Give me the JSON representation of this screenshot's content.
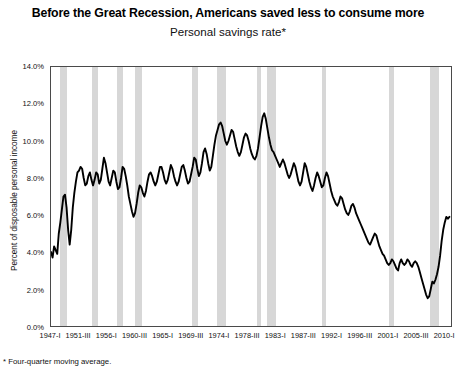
{
  "chart_data": {
    "type": "line",
    "title": "Before the Great Recession, Americans saved less to consume more",
    "subtitle": "Personal savings rate*",
    "footnote": "* Four-quarter moving average.",
    "xlabel": "",
    "ylabel": "Percent of disposable personal income",
    "ylim": [
      0,
      14
    ],
    "ytick_labels": [
      "0.0%",
      "2.0%",
      "4.0%",
      "6.0%",
      "8.0%",
      "10.0%",
      "12.0%",
      "14.0%"
    ],
    "ytick_values": [
      0,
      2,
      4,
      6,
      8,
      10,
      12,
      14
    ],
    "grid": false,
    "legend": "none",
    "line_color": "#000000",
    "band_color": "#d7d7d7",
    "xtick_labels": [
      "1947-I",
      "1951-III",
      "1956-I",
      "1960-III",
      "1965-I",
      "1969-III",
      "1974-I",
      "1978-III",
      "1983-I",
      "1987-III",
      "1992-I",
      "1996-III",
      "2001-I",
      "2005-III",
      "2010-I"
    ],
    "xtick_quarters": [
      0,
      18,
      36,
      54,
      72,
      90,
      108,
      126,
      144,
      162,
      180,
      198,
      216,
      234,
      252
    ],
    "x_start_quarter": 0,
    "x_end_quarter": 257,
    "recession_bands": [
      {
        "label": "1948-1949",
        "start": 6,
        "end": 10
      },
      {
        "label": "1953-1954",
        "start": 26,
        "end": 30
      },
      {
        "label": "1957-1958",
        "start": 42,
        "end": 46
      },
      {
        "label": "1960-1961",
        "start": 54,
        "end": 58
      },
      {
        "label": "1969-1970",
        "start": 90,
        "end": 94
      },
      {
        "label": "1973-1975",
        "start": 106,
        "end": 112
      },
      {
        "label": "1980",
        "start": 132,
        "end": 134
      },
      {
        "label": "1981-1982",
        "start": 138,
        "end": 144
      },
      {
        "label": "1990-1991",
        "start": 173,
        "end": 176
      },
      {
        "label": "2001",
        "start": 216,
        "end": 219
      },
      {
        "label": "2007-2009",
        "start": 242,
        "end": 248
      }
    ],
    "series": [
      {
        "name": "Personal savings rate",
        "values": [
          4.0,
          3.7,
          4.3,
          4.1,
          3.9,
          5.0,
          5.6,
          6.3,
          7.0,
          7.1,
          6.4,
          5.2,
          4.4,
          5.2,
          6.4,
          7.2,
          7.8,
          8.3,
          8.4,
          8.6,
          8.5,
          8.0,
          7.6,
          7.7,
          8.1,
          8.3,
          7.9,
          7.6,
          7.9,
          8.3,
          8.2,
          7.7,
          7.9,
          8.5,
          9.1,
          8.8,
          8.3,
          7.8,
          7.6,
          8.0,
          8.4,
          8.3,
          7.8,
          7.4,
          7.5,
          8.0,
          8.6,
          8.5,
          8.1,
          7.6,
          7.0,
          6.6,
          6.2,
          5.9,
          6.1,
          6.6,
          7.2,
          7.6,
          7.5,
          7.2,
          7.0,
          7.3,
          7.8,
          8.2,
          8.3,
          8.1,
          7.8,
          7.6,
          7.8,
          8.2,
          8.6,
          8.6,
          8.3,
          7.9,
          7.7,
          7.9,
          8.3,
          8.7,
          8.5,
          8.1,
          7.8,
          7.6,
          7.8,
          8.2,
          8.6,
          8.7,
          8.4,
          8.0,
          7.7,
          7.8,
          8.2,
          8.6,
          9.1,
          9.0,
          8.5,
          8.1,
          8.3,
          8.8,
          9.4,
          9.6,
          9.3,
          8.8,
          8.4,
          8.6,
          9.2,
          9.8,
          10.3,
          10.6,
          10.9,
          11.0,
          10.8,
          10.4,
          10.0,
          9.8,
          10.0,
          10.3,
          10.6,
          10.5,
          10.1,
          9.7,
          9.4,
          9.2,
          9.4,
          9.8,
          10.2,
          10.4,
          10.3,
          10.0,
          9.6,
          9.3,
          9.1,
          9.0,
          9.2,
          9.6,
          10.2,
          10.8,
          11.3,
          11.5,
          11.2,
          10.7,
          10.2,
          9.8,
          9.5,
          9.4,
          9.2,
          9.0,
          8.8,
          8.6,
          8.8,
          9.0,
          8.8,
          8.5,
          8.2,
          8.0,
          8.2,
          8.5,
          8.8,
          8.6,
          8.2,
          7.8,
          7.6,
          7.8,
          8.3,
          8.8,
          8.6,
          8.2,
          7.8,
          7.5,
          7.3,
          7.6,
          8.0,
          8.3,
          8.1,
          7.8,
          7.5,
          7.6,
          8.0,
          8.3,
          8.1,
          7.7,
          7.3,
          7.0,
          6.8,
          6.6,
          6.5,
          6.7,
          7.0,
          6.9,
          6.6,
          6.3,
          6.1,
          6.0,
          6.2,
          6.5,
          6.6,
          6.4,
          6.1,
          5.9,
          5.7,
          5.5,
          5.3,
          5.1,
          4.9,
          4.7,
          4.5,
          4.4,
          4.6,
          4.8,
          5.0,
          4.9,
          4.6,
          4.3,
          4.1,
          3.9,
          3.8,
          3.6,
          3.4,
          3.3,
          3.4,
          3.6,
          3.5,
          3.3,
          3.1,
          3.0,
          3.4,
          3.6,
          3.4,
          3.3,
          3.4,
          3.6,
          3.5,
          3.3,
          3.2,
          3.4,
          3.5,
          3.4,
          3.2,
          2.9,
          2.6,
          2.3,
          2.0,
          1.7,
          1.5,
          1.6,
          2.0,
          2.4,
          2.3,
          2.5,
          2.8,
          3.2,
          3.8,
          4.6,
          5.2,
          5.6,
          5.9,
          5.8,
          5.9
        ]
      }
    ]
  }
}
